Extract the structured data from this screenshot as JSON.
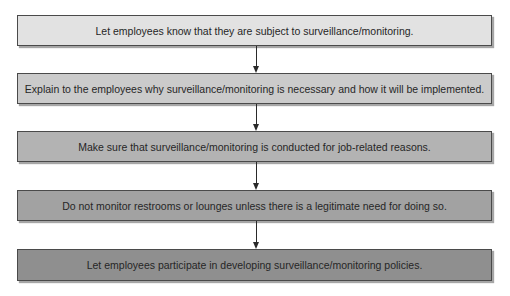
{
  "diagram": {
    "type": "vertical-flowchart",
    "steps": [
      {
        "label": "Let employees know that they are subject to surveillance/monitoring.",
        "fill": "#e2e2e2"
      },
      {
        "label": "Explain to the employees why surveillance/monitoring is necessary and how it will be implemented.",
        "fill": "#cbcbcb"
      },
      {
        "label": "Make sure that surveillance/monitoring is conducted for job-related reasons.",
        "fill": "#b3b3b3"
      },
      {
        "label": "Do not monitor restrooms or lounges unless there is a legitimate need for doing so.",
        "fill": "#a2a2a2"
      },
      {
        "label": "Let employees participate in developing surveillance/monitoring policies.",
        "fill": "#8f8f8f"
      }
    ],
    "connectors": [
      {
        "from": 0,
        "to": 1,
        "icon": "down-arrow-icon"
      },
      {
        "from": 1,
        "to": 2,
        "icon": "down-arrow-icon"
      },
      {
        "from": 2,
        "to": 3,
        "icon": "down-arrow-icon"
      },
      {
        "from": 3,
        "to": 4,
        "icon": "down-arrow-icon"
      }
    ],
    "colors": {
      "border": "#4a4a4a",
      "arrow": "#2a2a2a",
      "text": "#262626",
      "background": "#ffffff"
    }
  }
}
